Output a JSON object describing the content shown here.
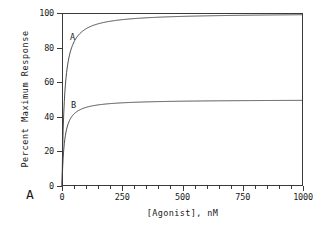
{
  "figure": {
    "panel_label": "A",
    "background_color": "#ffffff",
    "line_color": "#3a3a3a",
    "text_color": "#1a1a1a"
  },
  "chart_data": {
    "type": "line",
    "title": "",
    "xlabel": "[Agonist], nM",
    "ylabel": "Percent Maximum Response",
    "xlim": [
      0,
      1000
    ],
    "ylim": [
      0,
      100
    ],
    "grid": false,
    "legend": "inline-curve-labels",
    "x_ticks": [
      0,
      250,
      500,
      750,
      1000
    ],
    "x_tick_labels": [
      "0",
      "250",
      "500",
      "750",
      "1000"
    ],
    "x_minor_tick_step": 50,
    "y_ticks": [
      0,
      20,
      40,
      60,
      80,
      100
    ],
    "y_tick_labels": [
      "0",
      "20",
      "40",
      "60",
      "80",
      "100"
    ],
    "series": [
      {
        "name": "A",
        "label": "A",
        "emax": 100,
        "kd": 10,
        "model": "hyperbolic saturation: y = Emax * x / (Kd + x)",
        "x": [
          0,
          2,
          5,
          10,
          15,
          20,
          30,
          40,
          50,
          75,
          100,
          150,
          200,
          250,
          300,
          400,
          500,
          600,
          700,
          800,
          900,
          1000
        ],
        "values": [
          0,
          16.7,
          33.3,
          50,
          60,
          66.7,
          75,
          80,
          83.3,
          88.2,
          90.9,
          93.8,
          95.2,
          96.2,
          96.8,
          97.6,
          98,
          98.4,
          98.6,
          98.8,
          98.9,
          99
        ]
      },
      {
        "name": "B",
        "label": "B",
        "emax": 50,
        "kd": 10,
        "model": "hyperbolic saturation: y = Emax * x / (Kd + x)",
        "x": [
          0,
          2,
          5,
          10,
          15,
          20,
          30,
          40,
          50,
          75,
          100,
          150,
          200,
          250,
          300,
          400,
          500,
          600,
          700,
          800,
          900,
          1000
        ],
        "values": [
          0,
          8.3,
          16.7,
          25,
          30,
          33.3,
          37.5,
          40,
          41.7,
          44.1,
          45.5,
          46.9,
          47.6,
          48.1,
          48.4,
          48.8,
          49,
          49.2,
          49.3,
          49.4,
          49.5,
          49.5
        ]
      }
    ]
  }
}
